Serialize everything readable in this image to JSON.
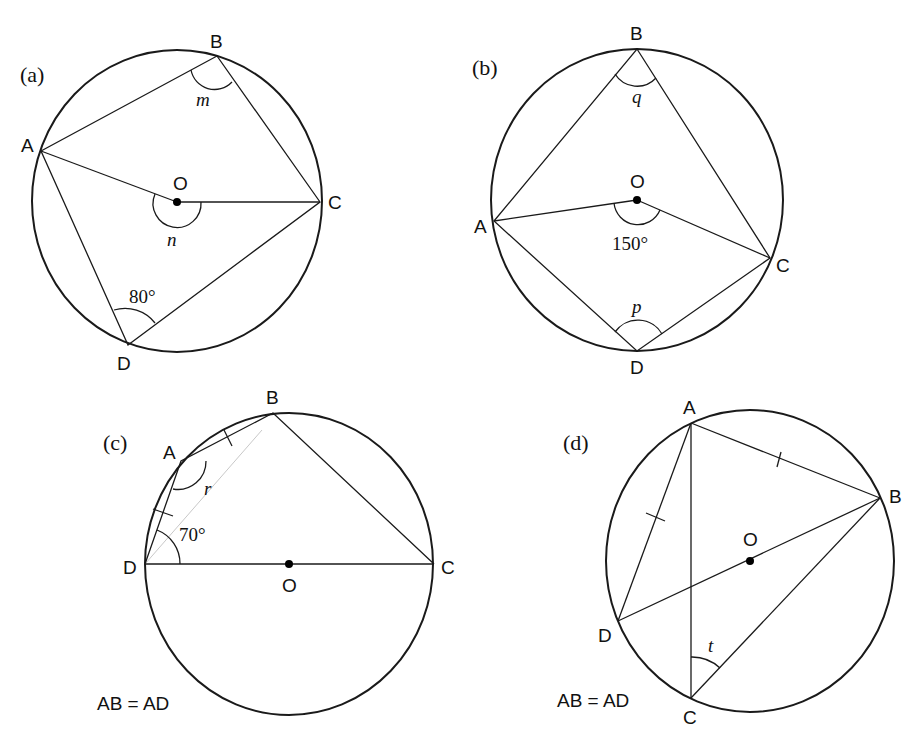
{
  "figures": [
    {
      "id": "a",
      "part_label": "(a)",
      "points": {
        "A": "A",
        "B": "B",
        "C": "C",
        "D": "D",
        "O": "O"
      },
      "angles": {
        "at_B": "m",
        "at_O": "n",
        "at_D": "80°"
      }
    },
    {
      "id": "b",
      "part_label": "(b)",
      "points": {
        "A": "A",
        "B": "B",
        "C": "C",
        "D": "D",
        "O": "O"
      },
      "angles": {
        "at_B": "q",
        "at_O": "150°",
        "at_D": "p"
      }
    },
    {
      "id": "c",
      "part_label": "(c)",
      "points": {
        "A": "A",
        "B": "B",
        "C": "C",
        "D": "D",
        "O": "O"
      },
      "angles": {
        "at_A": "r",
        "at_D": "70°"
      },
      "condition": "AB = AD"
    },
    {
      "id": "d",
      "part_label": "(d)",
      "points": {
        "A": "A",
        "B": "B",
        "C": "C",
        "D": "D",
        "O": "O"
      },
      "angles": {
        "at_C": "t"
      },
      "condition": "AB = AD"
    }
  ]
}
